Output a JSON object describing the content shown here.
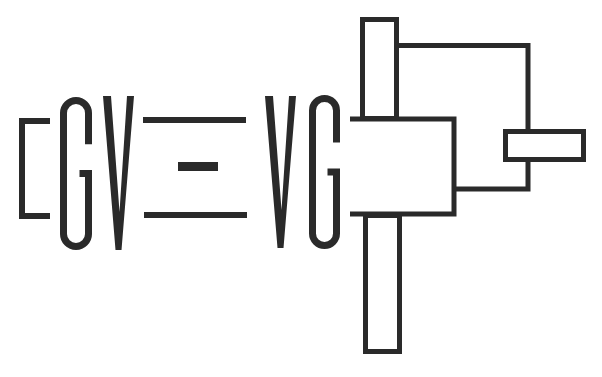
{
  "logo": {
    "text": "GV = VG",
    "ink_color": "#2a2a2a",
    "background": "#ffffff",
    "bracket": {
      "x1": 50,
      "top": 121,
      "x0": 22,
      "bottom": 216,
      "stroke": 6
    },
    "letters": [
      {
        "char": "G",
        "x": 60,
        "y": 97,
        "w": 32,
        "h": 153
      },
      {
        "char": "V",
        "x": 103,
        "y": 96,
        "w": 31,
        "h": 154
      },
      {
        "char": "V",
        "x": 265,
        "y": 96,
        "w": 31,
        "h": 152
      },
      {
        "char": "G",
        "x": 309,
        "y": 95,
        "w": 31,
        "h": 154
      }
    ],
    "equals": {
      "top_line": {
        "x": 143,
        "y": 117,
        "w": 103,
        "h": 6
      },
      "middle_dash": {
        "x": 178,
        "y": 162,
        "w": 40,
        "h": 9
      },
      "bottom_line": {
        "x": 144,
        "y": 212,
        "w": 103,
        "h": 6
      }
    },
    "structure": {
      "stroke": 5,
      "top_bar": {
        "x": 362.5,
        "y": 19.5,
        "w": 34,
        "h": 99
      },
      "bottom_bar": {
        "x": 365.5,
        "y": 215.5,
        "w": 34,
        "h": 136
      },
      "center_box": {
        "x": 350,
        "y": 119,
        "right": 454,
        "bottom": 214
      },
      "outer_frame": {
        "left": 397,
        "top": 45.5,
        "right": 528,
        "bottom": 189,
        "join_x": 454
      },
      "side_bar": {
        "x": 505.5,
        "y": 131.5,
        "w": 78,
        "h": 28
      }
    }
  }
}
